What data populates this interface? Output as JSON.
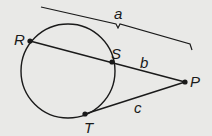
{
  "diagram": {
    "type": "geometry",
    "background": "#e9e9e7",
    "stroke_color": "#1a1a1a",
    "points": {
      "R": {
        "label": "R"
      },
      "S": {
        "label": "S"
      },
      "P": {
        "label": "P"
      },
      "T": {
        "label": "T"
      }
    },
    "segments": {
      "a": {
        "label": "a",
        "from": "R",
        "to": "P",
        "kind": "brace"
      },
      "b": {
        "label": "b",
        "from": "S",
        "to": "P",
        "kind": "secant-external"
      },
      "c": {
        "label": "c",
        "from": "T",
        "to": "P",
        "kind": "tangent"
      }
    }
  }
}
